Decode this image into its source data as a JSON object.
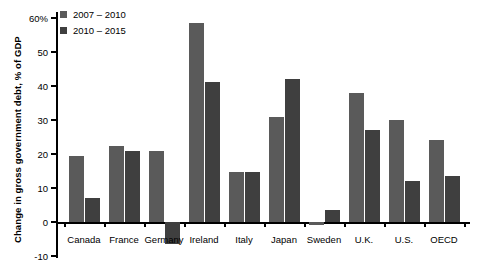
{
  "chart_data": {
    "type": "bar",
    "title": "",
    "xlabel": "",
    "ylabel": "Change in gross government debt, % of GDP",
    "ylim": [
      -10,
      60
    ],
    "yticks": [
      -10,
      0,
      10,
      20,
      30,
      40,
      50,
      60
    ],
    "ytick_labels": [
      "-10",
      "0",
      "10",
      "20",
      "30",
      "40",
      "50",
      "60%"
    ],
    "grid": false,
    "legend_position": "top-left",
    "categories": [
      "Canada",
      "France",
      "Germany",
      "Ireland",
      "Italy",
      "Japan",
      "Sweden",
      "U.K.",
      "U.S.",
      "OECD"
    ],
    "series": [
      {
        "name": "2007 – 2010",
        "color": "#5a5a5a",
        "values": [
          19.5,
          22.5,
          21.0,
          58.5,
          14.8,
          31.0,
          -1.0,
          38.0,
          30.0,
          24.0
        ]
      },
      {
        "name": "2010 – 2015",
        "color": "#3f3f3f",
        "values": [
          7.0,
          21.0,
          -6.5,
          41.2,
          14.8,
          42.0,
          3.5,
          27.0,
          12.2,
          13.6
        ]
      }
    ]
  },
  "axis": {
    "y_title": "Change in gross government debt, % of GDP"
  }
}
